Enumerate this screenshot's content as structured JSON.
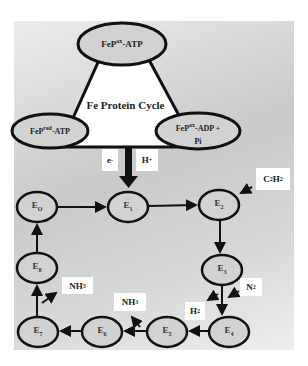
{
  "fe_cycle": {
    "title": "Fe Protein Cycle",
    "top": {
      "base": "FeP",
      "sup": "ox",
      "suffix": "-ATP"
    },
    "left": {
      "base": "FeP",
      "sup": "red",
      "suffix": "-ATP"
    },
    "right": {
      "base": "FeP",
      "sup": "ox",
      "suffix": "-ADP +",
      "line2": "Pi"
    }
  },
  "inputs": {
    "electron": {
      "base": "e",
      "sup": "-"
    },
    "proton": {
      "base": "H",
      "sup": "+"
    }
  },
  "states": [
    {
      "id": "E0",
      "base": "E",
      "sub": "O"
    },
    {
      "id": "E1",
      "base": "E",
      "sub": "1"
    },
    {
      "id": "E2",
      "base": "E",
      "sub": "2"
    },
    {
      "id": "E3",
      "base": "E",
      "sub": "3"
    },
    {
      "id": "E4",
      "base": "E",
      "sub": "4"
    },
    {
      "id": "E5",
      "base": "E",
      "sub": "5"
    },
    {
      "id": "E6",
      "base": "E",
      "sub": "6"
    },
    {
      "id": "E7",
      "base": "E",
      "sub": "7"
    },
    {
      "id": "E8",
      "base": "E",
      "sub": "8"
    }
  ],
  "substrates": {
    "c2h2": {
      "a": "C",
      "s1": "2",
      "b": "H",
      "s2": "2"
    },
    "n2": {
      "a": "N",
      "s1": "2"
    },
    "h2": {
      "a": "H",
      "s1": "2"
    },
    "nh3_right": {
      "a": "NH",
      "s1": "3"
    },
    "nh3_left": {
      "a": "NH",
      "s1": "3"
    }
  }
}
